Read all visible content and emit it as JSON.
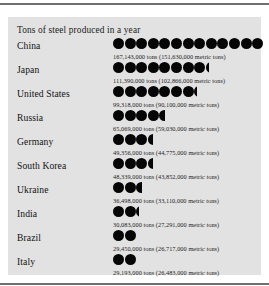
{
  "figure": {
    "title": "Tons of steel produced in a year",
    "dot_color": "#050505",
    "panel_color": "#e2e2e2",
    "rule_color": "#6f6f6f"
  },
  "chart_data": {
    "type": "bar",
    "title": "Tons of steel produced in a year",
    "xlabel": "",
    "ylabel": "",
    "categories": [
      "China",
      "Japan",
      "United States",
      "Russia",
      "Germany",
      "South Korea",
      "Ukraine",
      "India",
      "Brazil",
      "Italy"
    ],
    "values": [
      167143000,
      111390000,
      99318000,
      65069000,
      49356000,
      48339000,
      36498000,
      30083000,
      29450000,
      29193000
    ],
    "values_metric": [
      151630000,
      102866000,
      90100000,
      59030000,
      44775000,
      43852000,
      33110000,
      27291000,
      26717000,
      26483000
    ],
    "unit": "tons",
    "unit_secondary": "metric tons",
    "symbol_value": 12500000,
    "rows": [
      {
        "label": "China",
        "value_text": "167,143,000 tons (151,630,000 metric tons)",
        "dots_full": 13,
        "dot_partial": 0
      },
      {
        "label": "Japan",
        "value_text": "111,390,000 tons (102,866,000 metric tons)",
        "dots_full": 8,
        "dot_partial": 0.25
      },
      {
        "label": "United States",
        "value_text": "99,318,000 tons (90,100,000 metric tons)",
        "dots_full": 7,
        "dot_partial": 0.25
      },
      {
        "label": "Russia",
        "value_text": "65,069,000 tons (59,030,000 metric tons)",
        "dots_full": 4,
        "dot_partial": 0.5
      },
      {
        "label": "Germany",
        "value_text": "49,356,000 tons (44,775,000 metric tons)",
        "dots_full": 3,
        "dot_partial": 0.45
      },
      {
        "label": "South Korea",
        "value_text": "48,339,000 tons (43,852,000 metric tons)",
        "dots_full": 3,
        "dot_partial": 0.42
      },
      {
        "label": "Ukraine",
        "value_text": "36,498,000 tons (33,110,000 metric tons)",
        "dots_full": 2,
        "dot_partial": 0.55
      },
      {
        "label": "India",
        "value_text": "30,083,000 tons (27,291,000 metric tons)",
        "dots_full": 2,
        "dot_partial": 0.25
      },
      {
        "label": "Brazil",
        "value_text": "29,450,000 tons (26,717,000 metric tons)",
        "dots_full": 2,
        "dot_partial": 0
      },
      {
        "label": "Italy",
        "value_text": "29,193,000 tons (26,483,000 metric tons)",
        "dots_full": 2,
        "dot_partial": 0
      }
    ]
  }
}
